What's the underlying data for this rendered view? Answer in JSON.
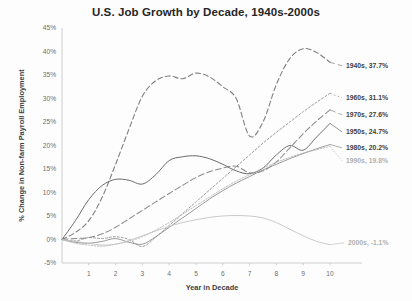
{
  "chart_data": {
    "type": "line",
    "title": "U.S. Job Growth by Decade, 1940s-2000s",
    "xlabel": "Year in Decade",
    "ylabel": "% Change in Non-farm Payroll Employment",
    "xlim": [
      0,
      10
    ],
    "ylim": [
      -5,
      45
    ],
    "yticks": [
      "-5%",
      "0%",
      "5%",
      "10%",
      "15%",
      "20%",
      "25%",
      "30%",
      "35%",
      "40%",
      "45%"
    ],
    "ytick_values": [
      -5,
      0,
      5,
      10,
      15,
      20,
      25,
      30,
      35,
      40,
      45
    ],
    "xticks": [
      "1",
      "2",
      "3",
      "4",
      "5",
      "6",
      "7",
      "8",
      "9",
      "10"
    ],
    "xtick_values": [
      1,
      2,
      3,
      4,
      5,
      6,
      7,
      8,
      9,
      10
    ],
    "grid": false,
    "legend_position": "right-inline-labels",
    "x": [
      0,
      0.5,
      1,
      1.5,
      2,
      2.5,
      3,
      3.5,
      4,
      4.5,
      5,
      5.5,
      6,
      6.5,
      7,
      7.5,
      8,
      8.5,
      9,
      9.5,
      10
    ],
    "series": [
      {
        "name": "1940s",
        "label": "1940s, 37.7%",
        "end_value": 37.7,
        "color": "#7f7f7f",
        "dash": "5,3",
        "width": 1.1,
        "label_x": 346,
        "label_y": 68,
        "values": [
          0,
          1.5,
          4.0,
          9.0,
          16.0,
          23.5,
          30.5,
          33.8,
          34.8,
          34.2,
          35.4,
          34.6,
          32.5,
          30.0,
          22.0,
          25.0,
          33.0,
          38.5,
          40.6,
          39.8,
          37.7
        ]
      },
      {
        "name": "1960s",
        "label": "1960s, 31.1%",
        "end_value": 31.1,
        "color": "#9a9a9a",
        "dash": "2,2",
        "width": 1.0,
        "label_x": 346,
        "label_y": 100,
        "values": [
          0,
          -0.3,
          0.4,
          0.2,
          0.6,
          0.0,
          -1.5,
          0.5,
          3.0,
          5.5,
          8.0,
          10.5,
          13.0,
          15.5,
          18.0,
          20.5,
          22.8,
          25.0,
          27.2,
          29.2,
          31.1
        ]
      },
      {
        "name": "1970s",
        "label": "1970s, 27.6%",
        "end_value": 27.6,
        "color": "#8a8a8a",
        "dash": "6,3",
        "width": 1.05,
        "label_x": 346,
        "label_y": 117,
        "values": [
          0,
          0.2,
          0.4,
          1.2,
          2.6,
          4.4,
          6.2,
          8.0,
          9.8,
          11.5,
          13.2,
          14.4,
          15.2,
          15.6,
          14.2,
          14.6,
          16.5,
          19.5,
          22.5,
          25.2,
          27.6
        ]
      },
      {
        "name": "1950s",
        "label": "1950s, 24.7%",
        "end_value": 24.7,
        "color": "#6b6b6b",
        "dash": "none",
        "width": 1.0,
        "label_x": 346,
        "label_y": 134,
        "values": [
          0,
          4.0,
          8.5,
          11.5,
          12.8,
          12.6,
          11.8,
          13.8,
          16.8,
          17.6,
          17.8,
          17.2,
          16.0,
          14.6,
          14.0,
          15.2,
          18.0,
          20.0,
          19.0,
          21.8,
          24.7
        ]
      },
      {
        "name": "1980s",
        "label": "1980s, 20.2%",
        "end_value": 20.2,
        "color": "#8f8f8f",
        "dash": "none",
        "width": 0.9,
        "label_x": 346,
        "label_y": 150,
        "values": [
          0,
          -0.6,
          -0.8,
          -0.4,
          0.2,
          -0.6,
          -1.0,
          0.6,
          2.6,
          4.6,
          6.6,
          8.6,
          10.4,
          12.0,
          13.4,
          14.8,
          16.0,
          17.2,
          18.3,
          19.3,
          20.2
        ]
      },
      {
        "name": "1990s",
        "label": "1990s, 19.8%",
        "end_value": 19.8,
        "color": "#b8b8b8",
        "dash": "1.5,1.5",
        "width": 0.9,
        "label_x": 346,
        "label_y": 163,
        "values": [
          0,
          -0.8,
          -1.2,
          -1.4,
          -1.0,
          -0.4,
          0.6,
          2.0,
          3.6,
          5.4,
          7.2,
          9.0,
          10.8,
          12.4,
          13.8,
          15.2,
          16.4,
          17.5,
          18.4,
          19.1,
          19.8
        ]
      },
      {
        "name": "2000s",
        "label": "2000s, -1.1%",
        "end_value": -1.1,
        "color": "#c4c4c4",
        "dash": "none",
        "width": 0.9,
        "label_x": 348,
        "label_y": 245,
        "values": [
          0,
          -0.4,
          -0.8,
          -1.2,
          -1.0,
          -0.2,
          0.8,
          1.8,
          2.8,
          3.6,
          4.2,
          4.7,
          5.0,
          5.1,
          5.0,
          4.6,
          3.6,
          2.2,
          0.8,
          -0.4,
          -1.1
        ]
      }
    ]
  }
}
